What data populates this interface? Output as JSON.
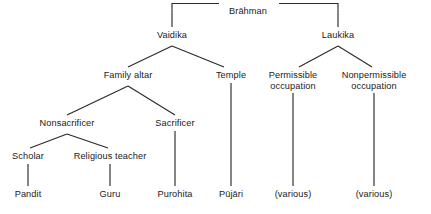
{
  "diagram": {
    "type": "hierarchy-tree",
    "line_color": "#2b2b2b",
    "text_color": "#1a1a1a",
    "background_color": "#ffffff",
    "nodes": [
      {
        "id": "brahman",
        "label": "Brāhman",
        "x": 248,
        "y": 12,
        "level": 0
      },
      {
        "id": "vaidika",
        "label": "Vaidika",
        "x": 172,
        "y": 36,
        "level": 1
      },
      {
        "id": "laukika",
        "label": "Laukika",
        "x": 338,
        "y": 36,
        "level": 1
      },
      {
        "id": "family-altar",
        "label": "Family altar",
        "x": 128,
        "y": 76,
        "level": 2
      },
      {
        "id": "temple",
        "label": "Temple",
        "x": 231,
        "y": 76,
        "level": 2
      },
      {
        "id": "permissible",
        "label": "Permissible occupation",
        "x": 293,
        "y": 76,
        "level": 2,
        "lines": [
          "Permissible",
          "occupation"
        ]
      },
      {
        "id": "nonpermissible",
        "label": "Nonpermissible occupation",
        "x": 374,
        "y": 76,
        "level": 2,
        "lines": [
          "Nonpermissible",
          "occupation"
        ]
      },
      {
        "id": "nonsacrificer",
        "label": "Nonsacrificer",
        "x": 67,
        "y": 124,
        "level": 3
      },
      {
        "id": "sacrificer",
        "label": "Sacrificer",
        "x": 175,
        "y": 124,
        "level": 3
      },
      {
        "id": "scholar",
        "label": "Scholar",
        "x": 28,
        "y": 157,
        "level": 4
      },
      {
        "id": "religious-teacher",
        "label": "Religious teacher",
        "x": 110,
        "y": 157,
        "level": 4
      },
      {
        "id": "pandit",
        "label": "Pandit",
        "x": 28,
        "y": 195,
        "level": 5
      },
      {
        "id": "guru",
        "label": "Guru",
        "x": 110,
        "y": 195,
        "level": 5
      },
      {
        "id": "purohita",
        "label": "Purohita",
        "x": 175,
        "y": 195,
        "level": 5
      },
      {
        "id": "pujari",
        "label": "Pūjāri",
        "x": 231,
        "y": 195,
        "level": 5
      },
      {
        "id": "various-left",
        "label": "(various)",
        "x": 293,
        "y": 195,
        "level": 5
      },
      {
        "id": "various-right",
        "label": "(various)",
        "x": 374,
        "y": 195,
        "level": 5
      }
    ],
    "edges": [
      {
        "from": "brahman",
        "to": "vaidika",
        "style": "bracket"
      },
      {
        "from": "brahman",
        "to": "laukika",
        "style": "bracket"
      },
      {
        "from": "vaidika",
        "to": "family-altar",
        "style": "diagonal"
      },
      {
        "from": "vaidika",
        "to": "temple",
        "style": "diagonal"
      },
      {
        "from": "laukika",
        "to": "permissible",
        "style": "diagonal"
      },
      {
        "from": "laukika",
        "to": "nonpermissible",
        "style": "diagonal"
      },
      {
        "from": "family-altar",
        "to": "nonsacrificer",
        "style": "diagonal"
      },
      {
        "from": "family-altar",
        "to": "sacrificer",
        "style": "diagonal"
      },
      {
        "from": "nonsacrificer",
        "to": "scholar",
        "style": "diagonal"
      },
      {
        "from": "nonsacrificer",
        "to": "religious-teacher",
        "style": "diagonal"
      },
      {
        "from": "scholar",
        "to": "pandit",
        "style": "vertical"
      },
      {
        "from": "religious-teacher",
        "to": "guru",
        "style": "vertical"
      },
      {
        "from": "sacrificer",
        "to": "purohita",
        "style": "vertical"
      },
      {
        "from": "temple",
        "to": "pujari",
        "style": "vertical"
      },
      {
        "from": "permissible",
        "to": "various-left",
        "style": "vertical"
      },
      {
        "from": "nonpermissible",
        "to": "various-right",
        "style": "vertical"
      }
    ]
  }
}
